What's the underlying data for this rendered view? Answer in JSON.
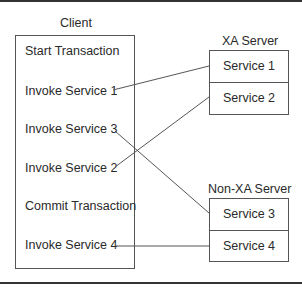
{
  "client": {
    "title": "Client",
    "steps": [
      "Start Transaction",
      "Invoke Service 1",
      "Invoke Service 3",
      "Invoke Service 2",
      "Commit Transaction",
      "Invoke Service 4"
    ]
  },
  "servers": [
    {
      "title": "XA Server",
      "services": [
        "Service 1",
        "Service 2"
      ]
    },
    {
      "title": "Non-XA Server",
      "services": [
        "Service 3",
        "Service 4"
      ]
    }
  ],
  "connections": [
    {
      "from": "Invoke Service 1",
      "to": "Service 1"
    },
    {
      "from": "Invoke Service 3",
      "to": "Service 3"
    },
    {
      "from": "Invoke Service 2",
      "to": "Service 2"
    },
    {
      "from": "Invoke Service 4",
      "to": "Service 4"
    }
  ],
  "colors": {
    "line": "#555555",
    "text": "#2a2a2a",
    "rule": "#333333"
  }
}
